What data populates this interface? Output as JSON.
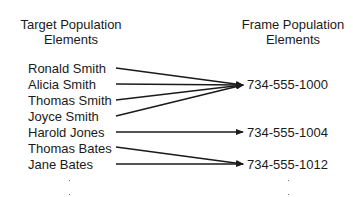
{
  "left_header": {
    "line1": "Target Population",
    "line2": "Elements"
  },
  "right_header": {
    "line1": "Frame Population",
    "line2": "Elements"
  },
  "target_elements": [
    {
      "name": "Ronald Smith",
      "maps_to": "734-555-1000"
    },
    {
      "name": "Alicia Smith",
      "maps_to": "734-555-1000"
    },
    {
      "name": "Thomas Smith",
      "maps_to": "734-555-1000"
    },
    {
      "name": "Joyce Smith",
      "maps_to": "734-555-1000"
    },
    {
      "name": "Harold Jones",
      "maps_to": "734-555-1004"
    },
    {
      "name": "Thomas Bates",
      "maps_to": "734-555-1012"
    },
    {
      "name": "Jane Bates",
      "maps_to": "734-555-1012"
    }
  ],
  "frame_elements": [
    {
      "number": "734-555-1000"
    },
    {
      "number": "734-555-1004"
    },
    {
      "number": "734-555-1012"
    }
  ],
  "continuation": {
    "left": "·\n·",
    "right": "·\n·"
  }
}
